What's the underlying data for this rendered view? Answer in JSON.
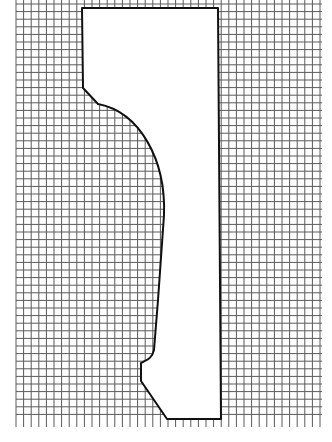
{
  "diagram": {
    "type": "profile-on-grid",
    "grid": {
      "x0": 16,
      "y0": 0,
      "x1": 322,
      "y1": 427,
      "cell": 7.6,
      "line_color": "#5a5a5a",
      "background": "#ffffff"
    },
    "shape": {
      "stroke_color": "#111111",
      "fill_color": "#ffffff",
      "stroke_width": 2,
      "path": "M82,8 L218,8 L221,419 L167,419 L141,381 L141,363 C146,360 152,359 154,350 L158,300 L164,215 C166,160 140,112 98,104 L83,88 Z"
    }
  }
}
